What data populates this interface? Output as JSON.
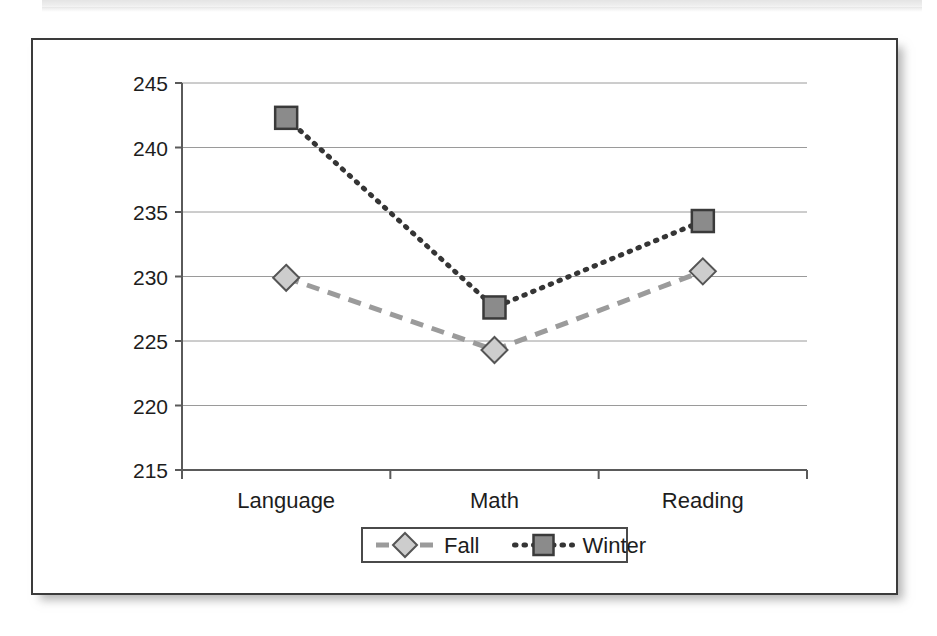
{
  "figure": {
    "frame_label": "line-chart-figure",
    "border_color": "#3b3b3b",
    "background": "#ffffff"
  },
  "chart_data": {
    "type": "line",
    "title": "",
    "subtitle": "",
    "xlabel": "",
    "ylabel": "",
    "categories": [
      "Language",
      "Math",
      "Reading"
    ],
    "series": [
      {
        "name": "Fall",
        "values": [
          229.9,
          224.3,
          230.4
        ],
        "marker": "diamond",
        "linestyle": "dashed",
        "color": "#9b9b9b",
        "marker_fill": "#cdcdcd"
      },
      {
        "name": "Winter",
        "values": [
          242.3,
          227.6,
          234.3
        ],
        "marker": "square",
        "linestyle": "dotted",
        "color": "#353535",
        "marker_fill": "#8b8b8b"
      }
    ],
    "ylim": [
      215,
      245
    ],
    "yticks": [
      215,
      220,
      225,
      230,
      235,
      240,
      245
    ],
    "ytick_labels": [
      "215",
      "220",
      "225",
      "230",
      "235",
      "240",
      "245"
    ],
    "grid": true,
    "grid_axis": "y",
    "legend_position": "bottom-center",
    "legend_entries": [
      "Fall",
      "Winter"
    ]
  }
}
